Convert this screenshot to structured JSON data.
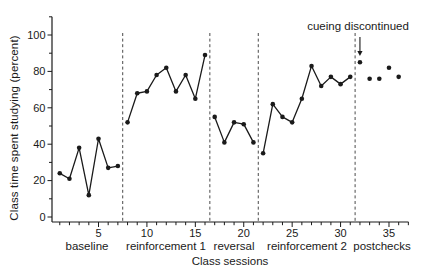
{
  "figure": {
    "background": "#ffffff",
    "ink_color": "#1a1a1a",
    "divider_color": "#4a4a4a"
  },
  "chart_data": {
    "type": "line",
    "title": "",
    "xlabel": "Class sessions",
    "ylabel": "Class time spent studying (percent)",
    "xlim": [
      0,
      37
    ],
    "ylim": [
      0,
      110
    ],
    "grid": false,
    "y_major_ticks": [
      0,
      20,
      40,
      60,
      80,
      100
    ],
    "y_minor_ticks": [
      10,
      30,
      50,
      70,
      90,
      110
    ],
    "x_label_ticks": [
      5,
      10,
      15,
      20,
      25,
      30,
      35
    ],
    "x_minor_tick_every": 1,
    "x_tick_range": [
      1,
      37
    ],
    "phase_dividers": [
      7.5,
      16.5,
      21.5,
      31.5
    ],
    "annotation": {
      "text": "cueing discontinued",
      "arrow_at_session": 32,
      "arrow_to_value": 85
    },
    "phases": [
      {
        "label": "baseline",
        "sessions": [
          1,
          7
        ],
        "connected": true,
        "values": [
          24,
          21,
          38,
          12,
          43,
          27,
          28
        ]
      },
      {
        "label": "reinforcement 1",
        "sessions": [
          8,
          16
        ],
        "connected": true,
        "values": [
          52,
          68,
          69,
          78,
          82,
          69,
          78,
          65,
          89
        ]
      },
      {
        "label": "reversal",
        "sessions": [
          17,
          21
        ],
        "connected": true,
        "values": [
          55,
          41,
          52,
          51,
          41
        ]
      },
      {
        "label": "reinforcement 2",
        "sessions": [
          22,
          31
        ],
        "connected": true,
        "values": [
          35,
          62,
          55,
          52,
          65,
          83,
          72,
          77,
          73,
          77
        ]
      },
      {
        "label": "postchecks",
        "sessions": [
          32,
          36
        ],
        "connected": false,
        "values": [
          85,
          76,
          76,
          82,
          77
        ]
      }
    ]
  }
}
